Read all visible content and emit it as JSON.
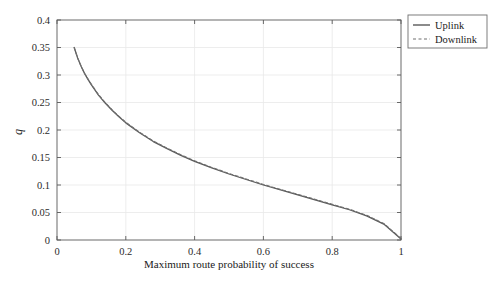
{
  "chart_data": {
    "type": "line",
    "title": "",
    "xlabel": "Maximum route probability of success",
    "ylabel": "q",
    "xlim": [
      0,
      1
    ],
    "ylim": [
      0,
      0.4
    ],
    "xticks": [
      "0",
      "0.2",
      "0.4",
      "0.6",
      "0.8",
      "1"
    ],
    "xtick_values": [
      0,
      0.2,
      0.4,
      0.6,
      0.8,
      1
    ],
    "yticks": [
      "0",
      "0.05",
      "0.1",
      "0.15",
      "0.2",
      "0.25",
      "0.3",
      "0.35",
      "0.4"
    ],
    "ytick_values": [
      0,
      0.05,
      0.1,
      0.15,
      0.2,
      0.25,
      0.3,
      0.35,
      0.4
    ],
    "grid": true,
    "legend_position": "upper-right",
    "legend_entries": [
      {
        "label": "Uplink",
        "style": "solid",
        "color": "#595959"
      },
      {
        "label": "Downlink",
        "style": "dashed",
        "color": "#707070"
      }
    ],
    "series": [
      {
        "name": "Uplink",
        "style": "solid",
        "color": "#595959",
        "x": [
          0.05,
          0.06,
          0.07,
          0.08,
          0.09,
          0.1,
          0.12,
          0.14,
          0.16,
          0.18,
          0.2,
          0.24,
          0.28,
          0.32,
          0.36,
          0.4,
          0.45,
          0.5,
          0.55,
          0.6,
          0.65,
          0.7,
          0.75,
          0.8,
          0.85,
          0.9,
          0.95,
          1.0
        ],
        "y": [
          0.35,
          0.331,
          0.316,
          0.303,
          0.292,
          0.282,
          0.264,
          0.249,
          0.236,
          0.224,
          0.213,
          0.195,
          0.179,
          0.166,
          0.154,
          0.143,
          0.131,
          0.12,
          0.11,
          0.1,
          0.091,
          0.082,
          0.073,
          0.064,
          0.055,
          0.044,
          0.029,
          0.002
        ]
      },
      {
        "name": "Downlink",
        "style": "dashed",
        "color": "#707070",
        "x": [
          0.05,
          0.06,
          0.07,
          0.08,
          0.09,
          0.1,
          0.12,
          0.14,
          0.16,
          0.18,
          0.2,
          0.24,
          0.28,
          0.32,
          0.36,
          0.4,
          0.45,
          0.5,
          0.55,
          0.6,
          0.65,
          0.7,
          0.75,
          0.8,
          0.85,
          0.9,
          0.95,
          1.0
        ],
        "y": [
          0.35,
          0.331,
          0.316,
          0.303,
          0.293,
          0.283,
          0.265,
          0.25,
          0.237,
          0.225,
          0.214,
          0.196,
          0.18,
          0.167,
          0.155,
          0.144,
          0.132,
          0.121,
          0.111,
          0.101,
          0.092,
          0.083,
          0.074,
          0.065,
          0.056,
          0.045,
          0.03,
          0.003
        ]
      }
    ]
  },
  "colors": {
    "background": "#ffffff",
    "axis": "#5a5a5a",
    "grid": "#e8e8e8",
    "uplink": "#595959",
    "downlink": "#707070",
    "legend_border": "#6f6f6f",
    "text": "#1a1a1a"
  }
}
